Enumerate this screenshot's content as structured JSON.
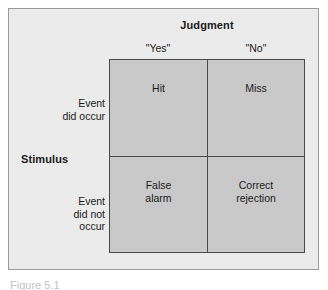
{
  "figure": {
    "title": "Judgment",
    "row_group_title": "Stimulus",
    "caption": "Figure 5.1"
  },
  "columns": [
    {
      "key": "yes",
      "label": "\"Yes\""
    },
    {
      "key": "no",
      "label": "\"No\""
    }
  ],
  "rows": [
    {
      "key": "occur",
      "label": "Event\ndid occur"
    },
    {
      "key": "not_occur",
      "label": "Event\ndid not\noccur"
    }
  ],
  "rows_text": {
    "occur_line1": "Event",
    "occur_line2": "did occur",
    "not_occur_line1": "Event",
    "not_occur_line2": "did not",
    "not_occur_line3": "occur"
  },
  "cells": {
    "hit": "Hit",
    "miss": "Miss",
    "false_alarm_line1": "False",
    "false_alarm_line2": "alarm",
    "correct_rejection_line1": "Correct",
    "correct_rejection_line2": "rejection"
  },
  "chart_data": {
    "type": "table",
    "column_group_label": "Judgment",
    "row_group_label": "Stimulus",
    "columns": [
      "\"Yes\"",
      "\"No\""
    ],
    "rows": [
      "Event did occur",
      "Event did not occur"
    ],
    "values": [
      [
        "Hit",
        "Miss"
      ],
      [
        "False alarm",
        "Correct rejection"
      ]
    ],
    "grid": true,
    "legend": "none"
  },
  "colors": {
    "page_background": "#ffffff",
    "panel_background": "#ebebeb",
    "panel_border": "#9a9a9a",
    "cell_fill": "#c9c9c9",
    "cell_border": "#4a4a4a",
    "text": "#1a1a1a",
    "caption_text": "#c2c2c2"
  }
}
